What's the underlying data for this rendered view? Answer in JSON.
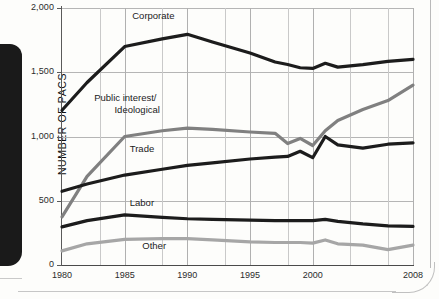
{
  "chart_data": {
    "type": "line",
    "title": "",
    "xlabel": "",
    "ylabel": "NUMBER OF PACS",
    "xlim": [
      1980,
      2008
    ],
    "ylim": [
      0,
      2000
    ],
    "grid": true,
    "legend": "inline-labels",
    "y_ticks": [
      "0",
      "500",
      "1,000",
      "1,500",
      "2,000"
    ],
    "y_tick_values": [
      0,
      500,
      1000,
      1500,
      2000
    ],
    "x_ticks": [
      "1980",
      "1985",
      "1990",
      "1995",
      "2000",
      "2008"
    ],
    "x_tick_values": [
      1980,
      1985,
      1990,
      1995,
      2000,
      2008
    ],
    "x": [
      1980,
      1982,
      1985,
      1988,
      1990,
      1992,
      1995,
      1997,
      1998,
      1999,
      2000,
      2001,
      2002,
      2004,
      2006,
      2008
    ],
    "series": [
      {
        "name": "Corporate",
        "color": "#1c1c1c",
        "label_x": 1987.2,
        "label_y": 1935,
        "values": [
          1204,
          1420,
          1700,
          1760,
          1795,
          1735,
          1650,
          1580,
          1560,
          1535,
          1530,
          1570,
          1540,
          1560,
          1585,
          1600
        ]
      },
      {
        "name": "Public interest/\nIdeological",
        "name_line1": "Public interest/",
        "name_line2": "Ideological",
        "color": "#808080",
        "label_x": 1986.0,
        "label_y": 1290,
        "values": [
          375,
          690,
          1000,
          1045,
          1065,
          1055,
          1035,
          1025,
          945,
          985,
          930,
          1045,
          1125,
          1210,
          1280,
          1400
        ]
      },
      {
        "name": "Trade",
        "color": "#1c1c1c",
        "label_x": 1987.0,
        "label_y": 905,
        "values": [
          574,
          630,
          700,
          745,
          775,
          795,
          825,
          840,
          845,
          885,
          835,
          1000,
          935,
          910,
          940,
          950
        ]
      },
      {
        "name": "Labor",
        "color": "#1c1c1c",
        "label_x": 1987.0,
        "label_y": 485,
        "values": [
          297,
          345,
          390,
          370,
          360,
          355,
          350,
          345,
          345,
          345,
          345,
          355,
          340,
          320,
          305,
          300
        ]
      },
      {
        "name": "Other",
        "color": "#a6a6a6",
        "label_x": 1988.0,
        "label_y": 150,
        "values": [
          110,
          165,
          200,
          205,
          205,
          195,
          180,
          175,
          175,
          175,
          170,
          195,
          165,
          155,
          120,
          155
        ]
      }
    ]
  }
}
